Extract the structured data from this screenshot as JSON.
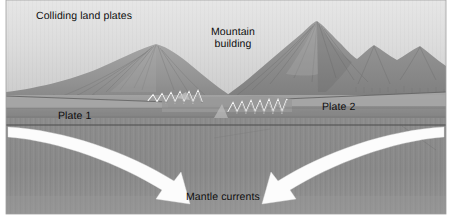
{
  "figure": {
    "width": 452,
    "height": 221,
    "palette": {
      "page_background": "#ffffff",
      "sky_top": "#e3e3e3",
      "sky_bottom": "#cfcfcf",
      "mountain_light": "#a8a8a8",
      "mountain_mid": "#8f8f8f",
      "mountain_dark": "#6f6f6f",
      "plate_upper": "#9b9b9b",
      "plate_lower": "#868686",
      "mantle": "#8a8a8a",
      "arrow_fill": "#fdfdfd",
      "outline": "#3c3c3c",
      "text": "#0d0d0d"
    }
  },
  "labels": {
    "colliding_land_plates": "Colliding land plates",
    "mountain_building": "Mountain\nbuilding",
    "mountain_building_line1": "Mountain",
    "mountain_building_line2": "building",
    "plate_1": "Plate 1",
    "plate_2": "Plate 2",
    "mantle_currents": "Mantle currents"
  },
  "elements": {
    "sky": "sky-gradient-band",
    "mountain_range": "mountain-range-silhouette",
    "peak_left": "left-peak",
    "peak_main": "main-peak",
    "fault_zigzag_left": "left-fault-zigzag",
    "fault_zigzag_right": "right-fault-zigzag",
    "plate_left_wedge": "plate-1-wedge",
    "plate_right_wedge": "plate-2-wedge",
    "mantle_region": "mantle-region",
    "arrow_left": "left-mantle-current-arrow",
    "arrow_right": "right-mantle-current-arrow"
  }
}
